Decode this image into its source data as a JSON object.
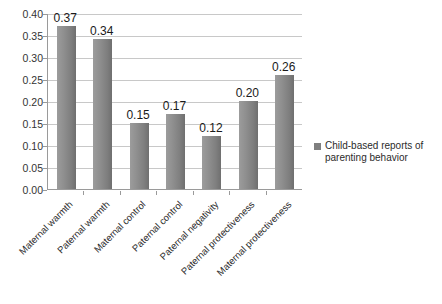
{
  "chart_data": {
    "type": "bar",
    "title": "",
    "subtitle": "",
    "xlabel": "",
    "ylabel": "",
    "categories": [
      "Maternal warmth",
      "Paternal warmth",
      "Maternal control",
      "Paternal control",
      "Paternal negativity",
      "Paternal protectiveness",
      "Maternal protectiveness"
    ],
    "values": [
      0.37,
      0.34,
      0.15,
      0.17,
      0.12,
      0.2,
      0.26
    ],
    "value_labels": [
      "0.37",
      "0.34",
      "0.15",
      "0.17",
      "0.12",
      "0.20",
      "0.26"
    ],
    "series": [
      {
        "name": "Child-based reports of parenting behavior",
        "values": [
          0.37,
          0.34,
          0.15,
          0.17,
          0.12,
          0.2,
          0.26
        ],
        "color": "#7f7f7f"
      }
    ],
    "ylim": [
      0.0,
      0.4
    ],
    "ytick_values": [
      0.0,
      0.05,
      0.1,
      0.15,
      0.2,
      0.25,
      0.3,
      0.35,
      0.4
    ],
    "ytick_labels": [
      "0.00",
      "0.05",
      "0.10",
      "0.15",
      "0.20",
      "0.25",
      "0.30",
      "0.35",
      "0.40"
    ],
    "grid": true,
    "grid_axis": "y",
    "legend_position": "right",
    "x_tick_label_rotation": -45,
    "data_labels_shown": true,
    "background_color": "#ffffff",
    "grid_color": "#c8c8c8",
    "axis_color": "#9a9a9a",
    "bar_color": "#7f7f7f"
  },
  "legend": {
    "entries": [
      {
        "label_line1": "Child-based reports of",
        "label_line2": "parenting behavior",
        "swatch_color": "#7f7f7f"
      }
    ]
  }
}
